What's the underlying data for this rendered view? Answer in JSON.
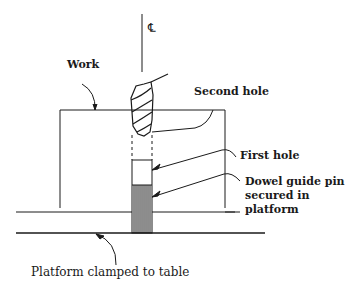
{
  "diagram": {
    "labels": {
      "centerline": "℄",
      "work": "Work",
      "second_hole": "Second hole",
      "first_hole": "First hole",
      "dowel_line1": "Dowel guide pin",
      "dowel_line2": "secured in",
      "dowel_line3": "platform",
      "platform": "Platform clamped to table"
    },
    "colors": {
      "ink": "#1a1a1a",
      "background": "#ffffff"
    }
  }
}
